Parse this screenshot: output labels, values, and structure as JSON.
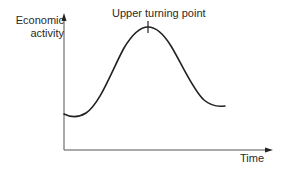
{
  "diagram": {
    "y_axis_label_line1": "Economic",
    "y_axis_label_line2": "activity",
    "x_axis_label": "Time",
    "annotation": "Upper turning point",
    "colors": {
      "line": "#222222",
      "axis": "#555555",
      "text": "#2a2a2a",
      "background": "#ffffff"
    }
  }
}
